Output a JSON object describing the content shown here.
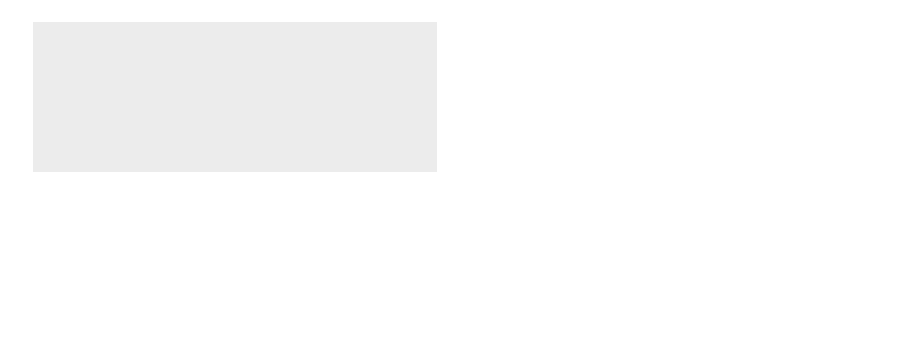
{
  "diagram": {
    "type": "process-flow",
    "colors": {
      "background": "#ffffff",
      "panel": "#ededed",
      "paper_web": "#111111",
      "rollers_fill": "#cfcfcf",
      "rollers_stroke": "#8a8a8a",
      "headbox": "#3a3a3a",
      "basins": "#d9d9d9",
      "badge_fill": "#9a9a9a",
      "reel": "#0a0a0a",
      "text": "#333333"
    },
    "sections": [
      {
        "number": "1",
        "label": "Stoffauflauf"
      },
      {
        "number": "2",
        "label": "Siebpartie"
      },
      {
        "number": "3",
        "label": "Pressenpartie"
      },
      {
        "number": "4",
        "label": "Trockenpartie"
      },
      {
        "number": "5",
        "label": "Glättwerk"
      }
    ],
    "reel": {
      "label": "Aufrollung",
      "sublabel": "Poperoller"
    },
    "water": {
      "basins": [
        {
          "label": "Siebwasser"
        },
        {
          "label": "Siebwasser"
        },
        {
          "label_line1": "Pressen-",
          "label_line2": "wasser"
        }
      ],
      "pipes": [
        {
          "label": "Wasser"
        },
        {
          "label": "Wasser"
        },
        {
          "label": "Wasser"
        }
      ]
    },
    "legend": [
      {
        "number": "2",
        "label": "Entwässern",
        "icon": "dewatering-icon"
      },
      {
        "number": "3",
        "label": "Pressen",
        "icon": "pressing-icon"
      },
      {
        "number": "4",
        "label": "Trocknen",
        "icon": "drying-icon"
      },
      {
        "number": "5",
        "label": "Glätten",
        "icon": "smoothing-icon"
      }
    ]
  }
}
